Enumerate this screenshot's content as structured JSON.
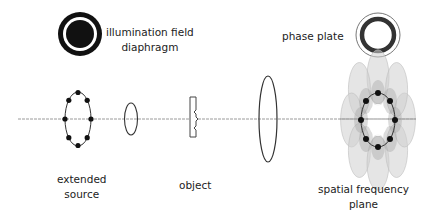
{
  "diagram": {
    "labels": {
      "illumination_field_diaphragm": [
        "illumination field",
        "diaphragm"
      ],
      "phase_plate": "phase plate",
      "extended_source": [
        "extended",
        "source"
      ],
      "object": "object",
      "spatial_frequency_plane": [
        "spatial frequency",
        "plane"
      ]
    },
    "elements": [
      {
        "id": "illumination-field-diaphragm",
        "type": "annular-aperture"
      },
      {
        "id": "extended-source",
        "type": "ring-source",
        "point_count": 8
      },
      {
        "id": "condenser-lens",
        "type": "lens"
      },
      {
        "id": "object",
        "type": "specimen"
      },
      {
        "id": "objective-lens",
        "type": "lens"
      },
      {
        "id": "spatial-frequency-plane",
        "type": "diffraction-ring",
        "point_count": 8
      },
      {
        "id": "phase-plate",
        "type": "annular-phase-ring"
      }
    ],
    "colors": {
      "stroke": "#222222",
      "axis": "#999999",
      "diffraction_light": "#cfcfcf",
      "diffraction_dark": "#9a9a9a",
      "background": "#ffffff"
    }
  }
}
